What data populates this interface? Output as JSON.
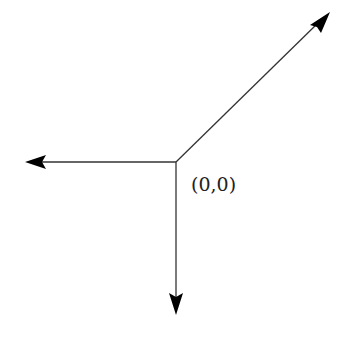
{
  "diagram": {
    "origin_label": "(0,0)",
    "origin": [
      176,
      162
    ],
    "vectors": [
      {
        "name": "left",
        "tip": [
          25,
          162
        ]
      },
      {
        "name": "down",
        "tip": [
          176,
          315
        ]
      },
      {
        "name": "up-right",
        "tip": [
          330,
          12
        ]
      }
    ],
    "stroke_color": "#333333",
    "arrowhead_color": "#000000"
  }
}
